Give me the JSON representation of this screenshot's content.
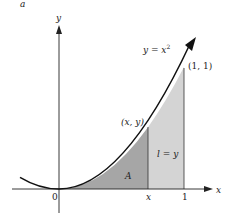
{
  "diagram": {
    "corner_label": "a",
    "axes": {
      "x_label": "x",
      "y_label": "y",
      "origin_label": "0"
    },
    "curve": {
      "equation_lhs": "y = x",
      "equation_exp": "2"
    },
    "points": {
      "moving_point": "(x, y)",
      "end_point": "(1, 1)"
    },
    "tick_labels": {
      "x_tick": "x",
      "one_tick": "1"
    },
    "regions": {
      "area_label": "A",
      "strip_label": "l = y"
    },
    "colors": {
      "area_dark": "#a6a6a6",
      "area_light": "#d4d4d4",
      "line": "#1a1a1a"
    }
  }
}
